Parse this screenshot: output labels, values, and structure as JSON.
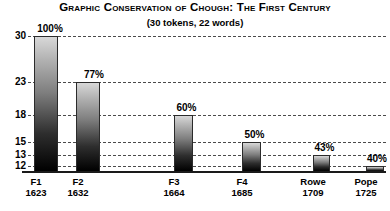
{
  "chart_data": {
    "type": "bar",
    "title": "Graphic Conservation of Chough: The First Century",
    "subtitle": "(30 tokens, 22 words)",
    "xlabel": "",
    "ylabel": "",
    "grid": true,
    "legend": null,
    "yticks": [
      30,
      23,
      18,
      15,
      13,
      12
    ],
    "ylim": [
      11,
      31
    ],
    "categories": [
      "F1",
      "F2",
      "F3",
      "F4",
      "Rowe",
      "Pope"
    ],
    "years": [
      1623,
      1632,
      1664,
      1685,
      1709,
      1725
    ],
    "values": [
      30,
      23,
      18,
      15,
      13,
      12
    ],
    "percent_labels": [
      "100%",
      "77%",
      "60%",
      "50%",
      "43%",
      "40%"
    ],
    "percents": [
      100,
      77,
      60,
      50,
      43,
      40
    ]
  },
  "axis": {
    "ticks": [
      {
        "label": "30",
        "top": 0
      },
      {
        "label": "23",
        "top": 46
      },
      {
        "label": "18",
        "top": 79
      },
      {
        "label": "15",
        "top": 106
      },
      {
        "label": "13",
        "top": 119
      },
      {
        "label": "12",
        "top": 130
      }
    ]
  },
  "bars": [
    {
      "name": "F1",
      "year": "1623",
      "label": "100%",
      "left": 6,
      "width": 24,
      "top": 0,
      "label_left": 3,
      "label_top": -12
    },
    {
      "name": "F2",
      "year": "1632",
      "label": "77%",
      "left": 48,
      "width": 24,
      "top": 46,
      "label_left": 47,
      "label_top": 34
    },
    {
      "name": "F3",
      "year": "1664",
      "label": "60%",
      "left": 146,
      "width": 19,
      "top": 79,
      "label_left": 142,
      "label_top": 67
    },
    {
      "name": "F4",
      "year": "1685",
      "label": "50%",
      "left": 214,
      "width": 19,
      "top": 106,
      "label_left": 210,
      "label_top": 94
    },
    {
      "name": "Rowe",
      "year": "1709",
      "label": "43%",
      "left": 285,
      "width": 17,
      "top": 119,
      "label_left": 281,
      "label_top": 107
    },
    {
      "name": "Pope",
      "year": "1725",
      "label": "40%",
      "left": 338,
      "width": 18,
      "top": 130,
      "label_left": 333,
      "label_top": 118
    }
  ],
  "xticks": [
    {
      "name": "F1",
      "year": "1623",
      "left": 16,
      "width": 40
    },
    {
      "name": "F2",
      "year": "1632",
      "left": 58,
      "width": 40
    },
    {
      "name": "F3",
      "year": "1664",
      "left": 154,
      "width": 40
    },
    {
      "name": "F4",
      "year": "1685",
      "left": 222,
      "width": 40
    },
    {
      "name": "Rowe",
      "year": "1709",
      "left": 291,
      "width": 44
    },
    {
      "name": "Pope",
      "year": "1725",
      "left": 345,
      "width": 42
    }
  ]
}
